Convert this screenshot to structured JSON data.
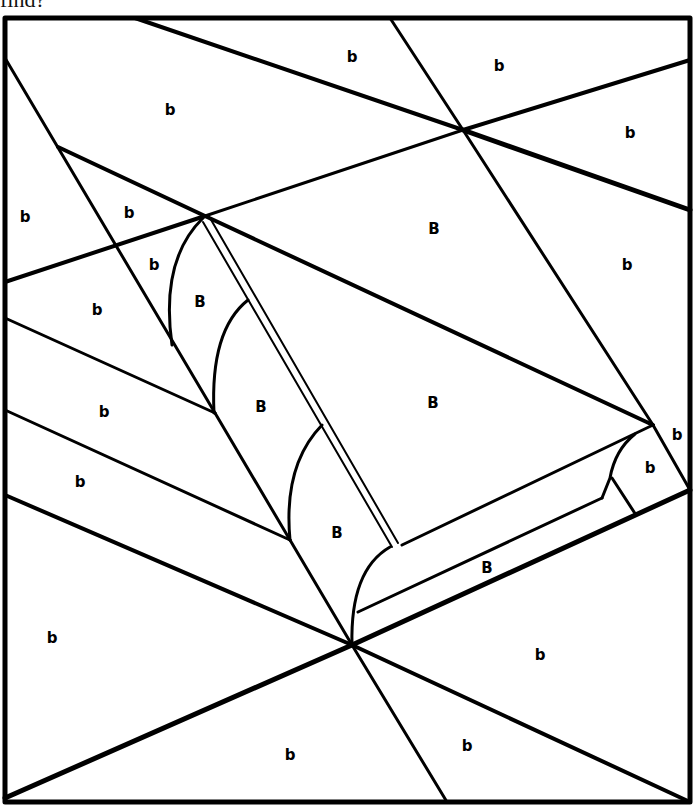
{
  "caption": "find?",
  "colors": {
    "ink": "#000000",
    "paper": "#ffffff"
  },
  "frame": {
    "x1": 5,
    "y1": 18,
    "x2": 690,
    "y2": 802
  },
  "lines": [
    {
      "x1": 135,
      "y1": 18,
      "x2": 463,
      "y2": 130,
      "w": 4
    },
    {
      "x1": 390,
      "y1": 18,
      "x2": 463,
      "y2": 130,
      "w": 3
    },
    {
      "x1": 463,
      "y1": 130,
      "x2": 690,
      "y2": 60,
      "w": 4
    },
    {
      "x1": 463,
      "y1": 130,
      "x2": 690,
      "y2": 210,
      "w": 5
    },
    {
      "x1": 463,
      "y1": 130,
      "x2": 205,
      "y2": 216,
      "w": 3
    },
    {
      "x1": 463,
      "y1": 130,
      "x2": 653,
      "y2": 425,
      "w": 3
    },
    {
      "x1": 653,
      "y1": 425,
      "x2": 690,
      "y2": 490,
      "w": 3
    },
    {
      "x1": 5,
      "y1": 58,
      "x2": 215,
      "y2": 413,
      "w": 3
    },
    {
      "x1": 58,
      "y1": 147,
      "x2": 205,
      "y2": 216,
      "w": 4
    },
    {
      "x1": 5,
      "y1": 282,
      "x2": 205,
      "y2": 216,
      "w": 4
    },
    {
      "x1": 205,
      "y1": 216,
      "x2": 653,
      "y2": 425,
      "w": 4
    },
    {
      "x1": 5,
      "y1": 318,
      "x2": 215,
      "y2": 413,
      "w": 3
    },
    {
      "x1": 215,
      "y1": 413,
      "x2": 290,
      "y2": 540,
      "w": 3
    },
    {
      "x1": 5,
      "y1": 410,
      "x2": 290,
      "y2": 540,
      "w": 3
    },
    {
      "x1": 290,
      "y1": 540,
      "x2": 352,
      "y2": 645,
      "w": 3
    },
    {
      "x1": 5,
      "y1": 495,
      "x2": 352,
      "y2": 645,
      "w": 4
    },
    {
      "x1": 210,
      "y1": 218,
      "x2": 398,
      "y2": 543,
      "w": 2
    },
    {
      "x1": 203,
      "y1": 222,
      "x2": 392,
      "y2": 547,
      "w": 2
    },
    {
      "x1": 402,
      "y1": 545,
      "x2": 653,
      "y2": 425,
      "w": 3
    },
    {
      "x1": 358,
      "y1": 612,
      "x2": 602,
      "y2": 498,
      "w": 3
    },
    {
      "x1": 612,
      "y1": 478,
      "x2": 636,
      "y2": 515,
      "w": 3
    },
    {
      "x1": 352,
      "y1": 645,
      "x2": 690,
      "y2": 490,
      "w": 5
    },
    {
      "x1": 352,
      "y1": 645,
      "x2": 5,
      "y2": 798,
      "w": 5
    },
    {
      "x1": 352,
      "y1": 645,
      "x2": 690,
      "y2": 802,
      "w": 4
    },
    {
      "x1": 352,
      "y1": 645,
      "x2": 447,
      "y2": 802,
      "w": 3
    }
  ],
  "curves": [
    {
      "d": "M 203 218 Q 160 260 172 345",
      "w": 3
    },
    {
      "d": "M 248 300 Q 210 330 214 413",
      "w": 3
    },
    {
      "d": "M 322 425 Q 283 465 290 540",
      "w": 3
    },
    {
      "d": "M 390 547 Q 350 570 352 645",
      "w": 3
    },
    {
      "d": "M 635 434 Q 615 450 610 478 L 602 498",
      "w": 3
    }
  ],
  "labels": [
    {
      "text": "b",
      "x": 352,
      "y": 57
    },
    {
      "text": "b",
      "x": 499,
      "y": 66
    },
    {
      "text": "b",
      "x": 170,
      "y": 110
    },
    {
      "text": "b",
      "x": 630,
      "y": 133
    },
    {
      "text": "b",
      "x": 25,
      "y": 217
    },
    {
      "text": "b",
      "x": 129,
      "y": 213
    },
    {
      "text": "B",
      "x": 434,
      "y": 229
    },
    {
      "text": "b",
      "x": 154,
      "y": 265
    },
    {
      "text": "b",
      "x": 627,
      "y": 265
    },
    {
      "text": "B",
      "x": 200,
      "y": 302
    },
    {
      "text": "b",
      "x": 97,
      "y": 310
    },
    {
      "text": "B",
      "x": 433,
      "y": 403
    },
    {
      "text": "B",
      "x": 261,
      "y": 407
    },
    {
      "text": "b",
      "x": 104,
      "y": 412
    },
    {
      "text": "b",
      "x": 677,
      "y": 435
    },
    {
      "text": "b",
      "x": 650,
      "y": 468
    },
    {
      "text": "b",
      "x": 80,
      "y": 482
    },
    {
      "text": "B",
      "x": 337,
      "y": 533
    },
    {
      "text": "B",
      "x": 487,
      "y": 568
    },
    {
      "text": "b",
      "x": 52,
      "y": 638
    },
    {
      "text": "b",
      "x": 540,
      "y": 655
    },
    {
      "text": "b",
      "x": 467,
      "y": 746
    },
    {
      "text": "b",
      "x": 290,
      "y": 755
    }
  ]
}
